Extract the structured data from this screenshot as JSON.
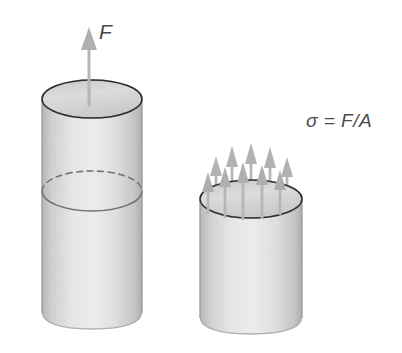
{
  "figure": {
    "background_color": "#ffffff",
    "width": 402,
    "height": 353
  },
  "labels": {
    "force": "F",
    "stress_formula": "σ = F/A"
  },
  "colors": {
    "body_light": "#f7f7f7",
    "body_mid": "#ececec",
    "body_shade": "#dcdcdc",
    "top_face": "#ebebeb",
    "outline": "#6e6e6e",
    "outline_soft": "#9a9a9a",
    "arrow": "#b6b6b6",
    "arrow_dark": "#a9a9a9",
    "text": "#4a4a4a",
    "dashed": "#777777"
  },
  "left_cylinder": {
    "name": "whole-bar-with-cut-plane",
    "center_x": 92,
    "radius_x": 50,
    "ellipse_ry": 19,
    "top_y": 99,
    "bottom_y": 329,
    "cut_plane_y": 191,
    "cut_plane_ry": 20
  },
  "right_cylinder": {
    "name": "lower-half-with-stress-arrows",
    "center_x": 251,
    "radius_x": 51,
    "ellipse_ry": 19,
    "top_y": 199,
    "bottom_y": 334
  },
  "force_arrow": {
    "name": "applied-force-arrow",
    "x": 89,
    "tip_y": 27,
    "shaft_bottom_y": 107,
    "head_height": 22,
    "head_width": 15,
    "shaft_width": 3
  },
  "stress_arrows": {
    "count": 10,
    "description": "Uniformly distributed internal stress arrows over the exposed cross-section",
    "back_row": [
      {
        "x": 216,
        "base_y": 201,
        "tip_y": 156
      },
      {
        "x": 232,
        "base_y": 197,
        "tip_y": 146
      },
      {
        "x": 251,
        "base_y": 195,
        "tip_y": 143
      },
      {
        "x": 270,
        "base_y": 197,
        "tip_y": 147
      },
      {
        "x": 287,
        "base_y": 201,
        "tip_y": 157
      }
    ],
    "front_row": [
      {
        "x": 208,
        "base_y": 214,
        "tip_y": 172
      },
      {
        "x": 225,
        "base_y": 218,
        "tip_y": 167
      },
      {
        "x": 243,
        "base_y": 220,
        "tip_y": 162
      },
      {
        "x": 262,
        "base_y": 219,
        "tip_y": 165
      },
      {
        "x": 280,
        "base_y": 215,
        "tip_y": 170
      }
    ]
  }
}
